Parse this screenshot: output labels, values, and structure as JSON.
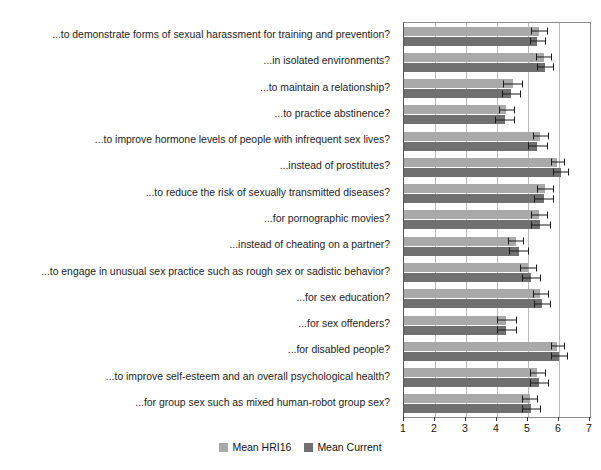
{
  "chart_data": {
    "type": "bar",
    "orientation": "horizontal",
    "title": "",
    "xlabel": "",
    "ylabel": "",
    "xlim": [
      1,
      7
    ],
    "xticks": [
      "1",
      "2",
      "3",
      "4",
      "5",
      "6",
      "7"
    ],
    "grid": true,
    "legend_position": "bottom-center",
    "colors": {
      "series_hri16": "#a9a9a9",
      "series_current": "#707070",
      "axis": "#8d8d8d",
      "gridline": "#b9b9b9",
      "error_bar": "#1a1a1a",
      "text": "#1a1a1a",
      "background": "#ffffff"
    },
    "categories": [
      "...to demonstrate forms of sexual harassment for training and prevention?",
      "...in isolated environments?",
      "...to maintain a relationship?",
      "...to practice abstinence?",
      "...to improve hormone levels of people with infrequent sex lives?",
      "...instead of prostitutes?",
      "...to reduce the risk of sexually transmitted diseases?",
      "...for pornographic movies?",
      "...instead of cheating on a partner?",
      "...to engage in unusual sex practice such as rough sex or sadistic behavior?",
      "...for sex education?",
      "...for sex offenders?",
      "...for disabled people?",
      "...to improve self-esteem and an overall psychological health?",
      "...for group sex such as mixed human-robot group sex?"
    ],
    "series": [
      {
        "name": "Mean HRI16",
        "color": "#a9a9a9",
        "values": [
          5.35,
          5.5,
          4.5,
          4.3,
          5.4,
          5.95,
          5.55,
          5.35,
          4.6,
          5.0,
          5.4,
          4.3,
          5.95,
          5.3,
          5.05
        ],
        "errors": [
          0.25,
          0.25,
          0.3,
          0.25,
          0.25,
          0.2,
          0.25,
          0.25,
          0.25,
          0.25,
          0.25,
          0.3,
          0.2,
          0.25,
          0.25
        ]
      },
      {
        "name": "Mean Current",
        "color": "#707070",
        "values": [
          5.3,
          5.55,
          4.45,
          4.25,
          5.3,
          6.05,
          5.5,
          5.4,
          4.7,
          5.1,
          5.45,
          4.3,
          6.0,
          5.35,
          5.1
        ],
        "errors": [
          0.25,
          0.25,
          0.3,
          0.3,
          0.3,
          0.25,
          0.3,
          0.3,
          0.3,
          0.3,
          0.25,
          0.3,
          0.25,
          0.3,
          0.3
        ]
      }
    ]
  },
  "legend": {
    "items": [
      {
        "label": "Mean HRI16",
        "swatch_class": "series-hri16"
      },
      {
        "label": "Mean Current",
        "swatch_class": "series-current"
      }
    ]
  }
}
